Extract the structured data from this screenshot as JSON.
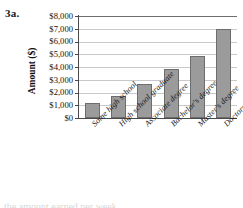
{
  "figure": {
    "label": "3a.",
    "bottom_caption": "the amount earned per week"
  },
  "chart_data": {
    "type": "bar",
    "title": "",
    "xlabel": "",
    "ylabel": "Amount ($)",
    "categories": [
      "Some high school",
      "High school graduate",
      "Associate degree",
      "Bachelor's degree",
      "Master's degree",
      "Doctorate degree"
    ],
    "values": [
      1150,
      1750,
      2700,
      3850,
      4900,
      6950
    ],
    "ylim": [
      0,
      8000
    ],
    "ytick_values": [
      0,
      1000,
      2000,
      3000,
      4000,
      5000,
      6000,
      7000,
      8000
    ],
    "ytick_labels": [
      "$0",
      "$1,000",
      "$2,000",
      "$3,000",
      "$4,000",
      "$5,000",
      "$6,000",
      "$7,000",
      "$8,000"
    ],
    "grid": true,
    "legend": false,
    "bar_color": "#9b9b9b",
    "bar_edge_color": "#6d6d6d",
    "grid_color": "#c9c9c9",
    "axis_color": "#4a4a4a"
  }
}
